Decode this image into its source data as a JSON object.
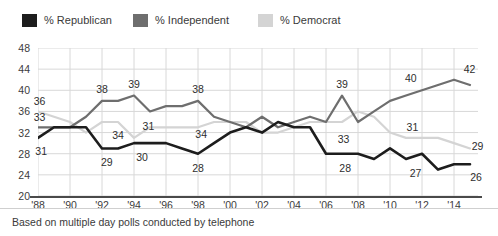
{
  "legend": {
    "items": [
      {
        "label": "% Republican",
        "color": "#1d1d1d",
        "x": 22
      },
      {
        "label": "% Independent",
        "color": "#6e6e6e",
        "x": 133
      },
      {
        "label": "% Democrat",
        "color": "#d4d4d4",
        "x": 258
      }
    ]
  },
  "footer": {
    "note": "Based on multiple day polls conducted by telephone"
  },
  "chart_data": {
    "type": "line",
    "title": "",
    "xlabel": "",
    "ylabel": "",
    "ylim": [
      20,
      48
    ],
    "ytick_step": 4,
    "yticks": [
      "20",
      "24",
      "28",
      "32",
      "36",
      "40",
      "44",
      "48"
    ],
    "xticks": [
      "'88",
      "'90",
      "'92",
      "'94",
      "'96",
      "'98",
      "'00",
      "'02",
      "'04",
      "'06",
      "'08",
      "'10",
      "'12",
      "'14"
    ],
    "xlim": [
      1988,
      2015.5
    ],
    "grid": true,
    "legend_position": "above",
    "series": [
      {
        "name": "% Republican",
        "color": "#1d1d1d",
        "x": [
          1988,
          1989,
          1990,
          1991,
          1992,
          1993,
          1994,
          1995,
          1996,
          1997,
          1998,
          1999,
          2000,
          2001,
          2002,
          2003,
          2004,
          2005,
          2006,
          2007,
          2008,
          2009,
          2010,
          2011,
          2012,
          2013,
          2014,
          2015
        ],
        "values": [
          31,
          33,
          33,
          33,
          29,
          29,
          30,
          30,
          30,
          29,
          28,
          30,
          32,
          33,
          32,
          34,
          33,
          33,
          28,
          28,
          28,
          27,
          29,
          27,
          28,
          25,
          26,
          26
        ]
      },
      {
        "name": "% Independent",
        "color": "#6e6e6e",
        "x": [
          1988,
          1989,
          1990,
          1991,
          1992,
          1993,
          1994,
          1995,
          1996,
          1997,
          1998,
          1999,
          2000,
          2001,
          2002,
          2003,
          2004,
          2005,
          2006,
          2007,
          2008,
          2009,
          2010,
          2011,
          2012,
          2013,
          2014,
          2015
        ],
        "values": [
          33,
          33,
          33,
          35,
          38,
          38,
          39,
          36,
          37,
          37,
          38,
          35,
          34,
          33,
          35,
          33,
          34,
          35,
          34,
          39,
          34,
          36,
          38,
          39,
          40,
          41,
          42,
          41
        ]
      },
      {
        "name": "% Democrat",
        "color": "#d4d4d4",
        "x": [
          1988,
          1989,
          1990,
          1991,
          1992,
          1993,
          1994,
          1995,
          1996,
          1997,
          1998,
          1999,
          2000,
          2001,
          2002,
          2003,
          2004,
          2005,
          2006,
          2007,
          2008,
          2009,
          2010,
          2011,
          2012,
          2013,
          2014,
          2015
        ],
        "values": [
          36,
          35,
          34,
          32,
          34,
          34,
          31,
          33,
          33,
          33,
          33,
          34,
          34,
          34,
          32,
          32,
          33,
          34,
          34,
          34,
          36,
          35,
          32,
          31,
          31,
          31,
          30,
          29
        ]
      }
    ],
    "point_labels": [
      {
        "text": "36",
        "series": "% Democrat",
        "x": 1988.1,
        "y": 36,
        "dx": 0,
        "dy": -10
      },
      {
        "text": "33",
        "series": "% Independent",
        "x": 1988.1,
        "y": 33,
        "dx": 0,
        "dy": -10
      },
      {
        "text": "31",
        "series": "% Republican",
        "x": 1988.2,
        "y": 31,
        "dx": 0,
        "dy": 13
      },
      {
        "text": "38",
        "series": "% Independent",
        "x": 1992,
        "y": 38,
        "dx": 0,
        "dy": -12
      },
      {
        "text": "39",
        "series": "% Independent",
        "x": 1994,
        "y": 39,
        "dx": 0,
        "dy": -12
      },
      {
        "text": "34",
        "series": "% Democrat",
        "x": 1993,
        "y": 34,
        "dx": 0,
        "dy": 13
      },
      {
        "text": "31",
        "series": "% Democrat",
        "x": 1994.9,
        "y": 31,
        "dx": 0,
        "dy": -12
      },
      {
        "text": "29",
        "series": "% Republican",
        "x": 1992.3,
        "y": 29,
        "dx": 0,
        "dy": 14
      },
      {
        "text": "30",
        "series": "% Republican",
        "x": 1994.5,
        "y": 30,
        "dx": 0,
        "dy": 14
      },
      {
        "text": "38",
        "series": "% Independent",
        "x": 1998,
        "y": 38,
        "dx": 0,
        "dy": -12
      },
      {
        "text": "34",
        "series": "% Democrat",
        "x": 1998.2,
        "y": 34,
        "dx": 0,
        "dy": 12
      },
      {
        "text": "28",
        "series": "% Republican",
        "x": 1998,
        "y": 28,
        "dx": 0,
        "dy": 14
      },
      {
        "text": "39",
        "series": "% Independent",
        "x": 2007,
        "y": 39,
        "dx": 0,
        "dy": -12
      },
      {
        "text": "33",
        "series": "% Republican",
        "x": 2007.1,
        "y": 33,
        "dx": 0,
        "dy": 12
      },
      {
        "text": "28",
        "series": "% Republican",
        "x": 2007.2,
        "y": 28,
        "dx": 0,
        "dy": 14
      },
      {
        "text": "40",
        "series": "% Independent",
        "x": 2011.3,
        "y": 40,
        "dx": 0,
        "dy": -12
      },
      {
        "text": "31",
        "series": "% Democrat",
        "x": 2011.4,
        "y": 31,
        "dx": 0,
        "dy": -11
      },
      {
        "text": "27",
        "series": "% Republican",
        "x": 2011.6,
        "y": 27,
        "dx": 0,
        "dy": 14
      },
      {
        "text": "42",
        "series": "% Independent",
        "x": 2014.6,
        "y": 42,
        "dx": 6,
        "dy": -11
      },
      {
        "text": "29",
        "series": "% Democrat",
        "x": 2015.1,
        "y": 29,
        "dx": 6,
        "dy": -2
      },
      {
        "text": "26",
        "series": "% Republican",
        "x": 2015.0,
        "y": 26,
        "dx": 6,
        "dy": 13
      }
    ]
  }
}
